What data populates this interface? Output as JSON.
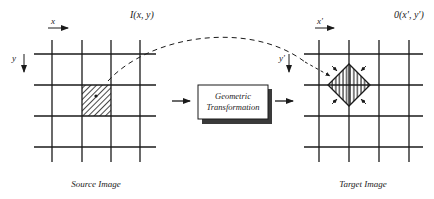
{
  "source": {
    "function_label": "I(x, y)",
    "x_axis_label": "x",
    "y_axis_label": "y",
    "caption": "Source Image"
  },
  "transform": {
    "line1": "Geometric",
    "line2": "Transformation"
  },
  "target": {
    "function_label": "0(x', y')",
    "x_axis_label": "x'",
    "y_axis_label": "y'",
    "caption": "Target Image"
  },
  "colors": {
    "line": "#1a1a1a",
    "shadow": "#3a3a3a",
    "background": "#ffffff"
  }
}
